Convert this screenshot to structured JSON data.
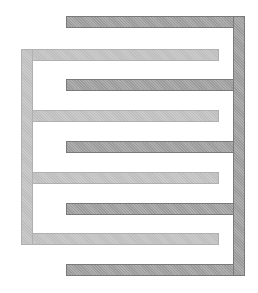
{
  "diagram": {
    "type": "interdigitated-comb-electrodes",
    "colors": {
      "dark_electrode": "#a8a8a8",
      "light_electrode": "#c8c8c8",
      "background": "#ffffff"
    },
    "dark_electrode": {
      "spine": {
        "x": 233,
        "y": 16,
        "w": 12,
        "h": 260
      },
      "fingers": [
        {
          "x": 66,
          "y": 16,
          "w": 179,
          "h": 12
        },
        {
          "x": 66,
          "y": 79,
          "w": 179,
          "h": 12
        },
        {
          "x": 66,
          "y": 141,
          "w": 179,
          "h": 12
        },
        {
          "x": 66,
          "y": 203,
          "w": 179,
          "h": 12
        },
        {
          "x": 66,
          "y": 264,
          "w": 179,
          "h": 12
        }
      ]
    },
    "light_electrode": {
      "spine": {
        "x": 21,
        "y": 49,
        "w": 12,
        "h": 196
      },
      "fingers": [
        {
          "x": 21,
          "y": 49,
          "w": 198,
          "h": 12
        },
        {
          "x": 21,
          "y": 110,
          "w": 198,
          "h": 12
        },
        {
          "x": 21,
          "y": 172,
          "w": 198,
          "h": 12
        },
        {
          "x": 21,
          "y": 233,
          "w": 198,
          "h": 12
        }
      ]
    }
  }
}
